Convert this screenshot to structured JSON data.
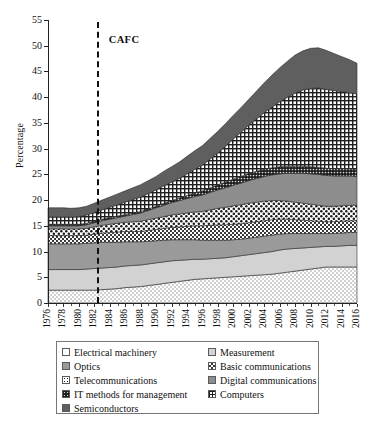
{
  "chart_data": {
    "type": "area",
    "title": "",
    "xlabel": "",
    "ylabel": "Percentage",
    "ylim": [
      0,
      55
    ],
    "ytick_values": [
      0,
      5,
      10,
      15,
      20,
      25,
      30,
      35,
      40,
      45,
      50,
      55
    ],
    "xtick_labels": [
      "1976",
      "1978",
      "1980",
      "1982",
      "1984",
      "1986",
      "1988",
      "1990",
      "1992",
      "1994",
      "1996",
      "1998",
      "2000",
      "2002",
      "2004",
      "2006",
      "2008",
      "2010",
      "2012",
      "2014",
      "2016"
    ],
    "x": [
      1976,
      1977,
      1978,
      1979,
      1980,
      1981,
      1982,
      1983,
      1984,
      1985,
      1986,
      1987,
      1988,
      1989,
      1990,
      1991,
      1992,
      1993,
      1994,
      1995,
      1996,
      1997,
      1998,
      1999,
      2000,
      2001,
      2002,
      2003,
      2004,
      2005,
      2006,
      2007,
      2008,
      2009,
      2010,
      2011,
      2012,
      2013,
      2014,
      2015,
      2016
    ],
    "grid": false,
    "legend_position": "below-plot",
    "stack_order_bottom_to_top": [
      "Electrical machinery",
      "Measurement",
      "Optics",
      "Basic communications",
      "Telecommunications",
      "Digital communications",
      "IT methods for management",
      "Computers",
      "Semiconductors"
    ],
    "annotations": [
      {
        "label": "CAFC",
        "type": "vertical-dashed-line",
        "x": 1982.3
      }
    ],
    "series": [
      {
        "name": "Electrical machinery",
        "pattern": "fine-dots",
        "color": "#f2f2f2",
        "values": [
          2.5,
          2.5,
          2.5,
          2.5,
          2.5,
          2.5,
          2.5,
          2.6,
          2.7,
          2.8,
          3.0,
          3.1,
          3.2,
          3.4,
          3.6,
          3.8,
          4.0,
          4.2,
          4.4,
          4.6,
          4.7,
          4.8,
          4.9,
          5.0,
          5.1,
          5.2,
          5.3,
          5.4,
          5.5,
          5.6,
          5.8,
          6.0,
          6.2,
          6.4,
          6.6,
          6.8,
          7.0,
          7.0,
          7.0,
          7.0,
          7.0
        ]
      },
      {
        "name": "Measurement",
        "pattern": "solid",
        "color": "#d2d2d2",
        "values": [
          4.0,
          4.0,
          4.0,
          4.0,
          4.0,
          4.1,
          4.2,
          4.2,
          4.2,
          4.2,
          4.2,
          4.2,
          4.2,
          4.2,
          4.2,
          4.2,
          4.2,
          4.1,
          4.0,
          3.9,
          3.8,
          3.8,
          3.8,
          3.8,
          3.9,
          4.0,
          4.1,
          4.2,
          4.3,
          4.4,
          4.5,
          4.5,
          4.4,
          4.3,
          4.2,
          4.1,
          4.0,
          4.0,
          4.1,
          4.2,
          4.2
        ]
      },
      {
        "name": "Optics",
        "pattern": "solid",
        "color": "#9a9a9a",
        "values": [
          5.0,
          5.0,
          5.0,
          5.0,
          5.0,
          5.0,
          5.0,
          5.0,
          4.9,
          4.8,
          4.7,
          4.6,
          4.5,
          4.4,
          4.3,
          4.2,
          4.1,
          4.0,
          3.9,
          3.8,
          3.7,
          3.6,
          3.5,
          3.4,
          3.3,
          3.2,
          3.2,
          3.2,
          3.2,
          3.2,
          3.1,
          3.0,
          2.9,
          2.8,
          2.7,
          2.6,
          2.5,
          2.5,
          2.5,
          2.5,
          2.5
        ]
      },
      {
        "name": "Basic communications",
        "pattern": "checker",
        "color": "#9c9c9c",
        "values": [
          1.6,
          1.6,
          1.6,
          1.6,
          1.6,
          1.6,
          1.7,
          1.8,
          1.9,
          2.0,
          2.0,
          2.0,
          2.0,
          2.1,
          2.2,
          2.3,
          2.4,
          2.5,
          2.6,
          2.7,
          2.8,
          2.9,
          3.0,
          3.0,
          3.0,
          3.0,
          3.0,
          3.0,
          3.0,
          3.0,
          2.9,
          2.8,
          2.7,
          2.6,
          2.5,
          2.4,
          2.3,
          2.3,
          2.3,
          2.3,
          2.3
        ]
      },
      {
        "name": "Telecommunications",
        "pattern": "white-dots",
        "color": "#ffffff",
        "values": [
          1.3,
          1.3,
          1.3,
          1.3,
          1.3,
          1.3,
          1.4,
          1.5,
          1.6,
          1.7,
          1.8,
          1.9,
          2.0,
          2.1,
          2.2,
          2.3,
          2.4,
          2.5,
          2.6,
          2.7,
          2.8,
          3.0,
          3.2,
          3.4,
          3.6,
          3.7,
          3.8,
          3.8,
          3.8,
          3.7,
          3.6,
          3.5,
          3.4,
          3.3,
          3.2,
          3.1,
          3.0,
          3.0,
          3.0,
          3.0,
          3.0
        ]
      },
      {
        "name": "Digital communications",
        "pattern": "solid",
        "color": "#8d8d8d",
        "values": [
          0.6,
          0.6,
          0.6,
          0.6,
          0.6,
          0.7,
          0.8,
          0.9,
          1.0,
          1.1,
          1.2,
          1.4,
          1.6,
          1.8,
          2.0,
          2.2,
          2.4,
          2.6,
          2.8,
          3.0,
          3.2,
          3.4,
          3.6,
          3.8,
          4.0,
          4.2,
          4.4,
          4.6,
          4.8,
          5.0,
          5.2,
          5.4,
          5.6,
          5.8,
          5.9,
          6.0,
          6.0,
          5.9,
          5.8,
          5.7,
          5.6
        ]
      },
      {
        "name": "IT methods for management",
        "pattern": "dense-dark-dots",
        "color": "#2a2a2a",
        "values": [
          0.3,
          0.3,
          0.3,
          0.3,
          0.3,
          0.3,
          0.3,
          0.3,
          0.3,
          0.3,
          0.3,
          0.3,
          0.3,
          0.3,
          0.3,
          0.4,
          0.4,
          0.5,
          0.6,
          0.7,
          0.8,
          0.9,
          1.0,
          1.1,
          1.2,
          1.3,
          1.4,
          1.4,
          1.4,
          1.4,
          1.4,
          1.4,
          1.4,
          1.4,
          1.4,
          1.4,
          1.4,
          1.4,
          1.4,
          1.4,
          1.4
        ]
      },
      {
        "name": "Computers",
        "pattern": "grid-crosshatch",
        "color": "#ffffff",
        "values": [
          1.4,
          1.4,
          1.4,
          1.4,
          1.5,
          1.6,
          1.7,
          1.8,
          2.0,
          2.2,
          2.4,
          2.6,
          2.8,
          3.0,
          3.2,
          3.4,
          3.6,
          3.8,
          4.2,
          4.6,
          5.0,
          5.6,
          6.2,
          7.0,
          7.8,
          8.6,
          9.4,
          10.2,
          11.0,
          11.8,
          12.6,
          13.4,
          14.2,
          14.8,
          15.2,
          15.4,
          15.3,
          15.2,
          15.0,
          14.8,
          14.6
        ]
      },
      {
        "name": "Semiconductors",
        "pattern": "solid",
        "color": "#5f5f5f",
        "values": [
          1.8,
          1.8,
          1.8,
          1.7,
          1.7,
          1.7,
          1.8,
          1.9,
          2.0,
          2.1,
          2.2,
          2.3,
          2.4,
          2.5,
          2.6,
          2.8,
          3.0,
          3.2,
          3.4,
          3.6,
          3.8,
          4.0,
          4.2,
          4.4,
          4.6,
          4.8,
          5.0,
          5.4,
          5.8,
          6.2,
          6.6,
          7.0,
          7.4,
          7.6,
          7.8,
          7.8,
          7.6,
          7.2,
          6.8,
          6.4,
          6.0
        ]
      }
    ]
  },
  "legend": {
    "items": [
      {
        "label": "Electrical machinery",
        "pattern": "fine-dots"
      },
      {
        "label": "Measurement",
        "pattern": "solid-light"
      },
      {
        "label": "Optics",
        "pattern": "solid-mid"
      },
      {
        "label": "Basic communications",
        "pattern": "checker"
      },
      {
        "label": "Telecommunications",
        "pattern": "white-dots"
      },
      {
        "label": "Digital communications",
        "pattern": "solid-mid2"
      },
      {
        "label": "IT methods for management",
        "pattern": "dense-dark-dots"
      },
      {
        "label": "Computers",
        "pattern": "grid-crosshatch"
      },
      {
        "label": "Semiconductors",
        "pattern": "solid-dark"
      }
    ]
  }
}
